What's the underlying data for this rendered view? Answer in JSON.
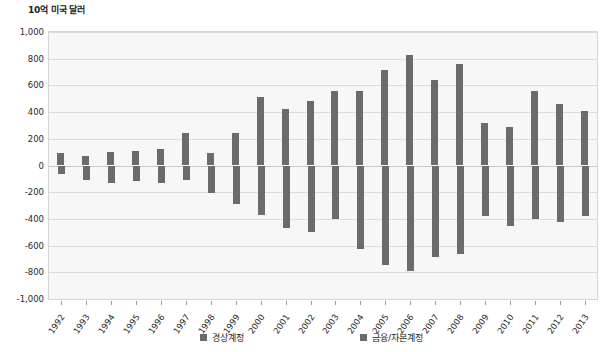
{
  "chart_data": {
    "type": "bar",
    "title": "10억 미국 달러",
    "xlabel": "",
    "ylabel": "10억 미국 달러",
    "ylim": [
      -1000,
      1000
    ],
    "ytick_step": 200,
    "grid": true,
    "legend_position": "bottom",
    "categories": [
      "1992",
      "1993",
      "1994",
      "1995",
      "1996",
      "1997",
      "1998",
      "1999",
      "2000",
      "2001",
      "2002",
      "2003",
      "2004",
      "2005",
      "2006",
      "2007",
      "2008",
      "2009",
      "2010",
      "2011",
      "2012",
      "2013"
    ],
    "series": [
      {
        "name": "경상계정",
        "color": "#6b6b6b",
        "values": [
          90,
          70,
          100,
          110,
          120,
          240,
          90,
          240,
          510,
          420,
          480,
          560,
          560,
          715,
          825,
          640,
          760,
          320,
          285,
          560,
          460,
          405
        ]
      },
      {
        "name": "금융/자본계정",
        "color": "#6b6b6b",
        "values": [
          -60,
          -110,
          -130,
          -115,
          -130,
          -110,
          -205,
          -290,
          -370,
          -465,
          -500,
          -400,
          -625,
          -745,
          -790,
          -685,
          -660,
          -375,
          -450,
          -400,
          -420,
          -375
        ]
      }
    ],
    "ytick_labels": [
      "1,000",
      "800",
      "600",
      "400",
      "200",
      "0",
      "-200",
      "-400",
      "-600",
      "-800",
      "-1,000"
    ],
    "ytick_values": [
      1000,
      800,
      600,
      400,
      200,
      0,
      -200,
      -400,
      -600,
      -800,
      -1000
    ]
  },
  "legend": {
    "items": [
      {
        "label": "경상계정",
        "color": "#6b6b6b"
      },
      {
        "label": "금융/자본계정",
        "color": "#6b6b6b"
      }
    ]
  },
  "colors": {
    "bar": "#6b6b6b",
    "plot_background": "#f7f7f7",
    "gridline": "#dcdcdc",
    "text": "#1c1c1c"
  }
}
